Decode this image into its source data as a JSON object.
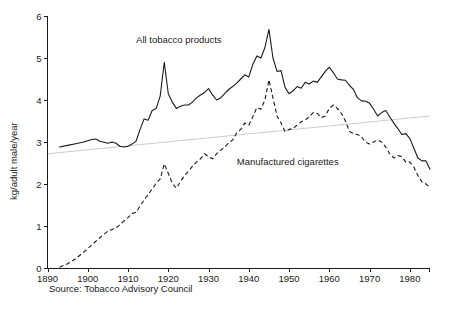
{
  "chart_data": {
    "type": "line",
    "title": "",
    "xlabel": "",
    "ylabel": "kg/adult male/year",
    "xlim": [
      1890,
      1985
    ],
    "ylim": [
      0,
      6
    ],
    "grid": false,
    "legend_position": "inline-annotation",
    "xticks": [
      1890,
      1900,
      1910,
      1920,
      1930,
      1940,
      1950,
      1960,
      1970,
      1980
    ],
    "yticks": [
      0,
      1,
      2,
      3,
      4,
      5,
      6
    ],
    "source": "Source: Tobacco Advisory Council",
    "annotations": [
      {
        "text": "All tobacco products",
        "x": 1912,
        "y": 5.35
      },
      {
        "text": "Manufactured cigarettes",
        "x": 1937,
        "y": 2.45
      }
    ],
    "series": [
      {
        "name": "All tobacco products",
        "style": "solid",
        "color": "#1a1a1a",
        "x": [
          1893,
          1895,
          1897,
          1899,
          1901,
          1902,
          1903,
          1905,
          1906,
          1907,
          1908,
          1909,
          1910,
          1911,
          1912,
          1913,
          1914,
          1915,
          1916,
          1917,
          1918,
          1919,
          1920,
          1921,
          1922,
          1923,
          1924,
          1925,
          1926,
          1927,
          1928,
          1929,
          1930,
          1931,
          1932,
          1933,
          1934,
          1935,
          1936,
          1937,
          1938,
          1939,
          1940,
          1941,
          1942,
          1943,
          1944,
          1945,
          1946,
          1947,
          1948,
          1949,
          1950,
          1951,
          1952,
          1953,
          1954,
          1955,
          1956,
          1957,
          1958,
          1959,
          1960,
          1961,
          1962,
          1963,
          1964,
          1965,
          1966,
          1967,
          1968,
          1969,
          1970,
          1971,
          1972,
          1973,
          1974,
          1975,
          1976,
          1977,
          1978,
          1979,
          1980,
          1981,
          1982,
          1983,
          1984,
          1985
        ],
        "y": [
          2.88,
          2.92,
          2.96,
          3.0,
          3.06,
          3.07,
          3.02,
          2.97,
          3.0,
          2.97,
          2.9,
          2.88,
          2.9,
          2.95,
          3.02,
          3.3,
          3.55,
          3.52,
          3.75,
          3.8,
          4.1,
          4.9,
          4.15,
          3.95,
          3.8,
          3.85,
          3.88,
          3.88,
          3.95,
          4.05,
          4.12,
          4.18,
          4.27,
          4.12,
          4.0,
          4.05,
          4.15,
          4.25,
          4.32,
          4.4,
          4.5,
          4.6,
          4.55,
          4.85,
          5.05,
          5.0,
          5.25,
          5.68,
          5.0,
          4.68,
          4.7,
          4.3,
          4.15,
          4.22,
          4.32,
          4.28,
          4.42,
          4.38,
          4.45,
          4.42,
          4.55,
          4.68,
          4.78,
          4.65,
          4.5,
          4.48,
          4.47,
          4.35,
          4.25,
          4.05,
          3.98,
          3.97,
          3.92,
          3.78,
          3.62,
          3.7,
          3.75,
          3.6,
          3.45,
          3.32,
          3.18,
          3.2,
          3.08,
          2.85,
          2.62,
          2.55,
          2.55,
          2.35
        ]
      },
      {
        "name": "Manufactured cigarettes",
        "style": "dashed",
        "color": "#1a1a1a",
        "x": [
          1893,
          1895,
          1897,
          1899,
          1901,
          1903,
          1905,
          1907,
          1909,
          1910,
          1911,
          1912,
          1913,
          1914,
          1915,
          1916,
          1917,
          1918,
          1919,
          1920,
          1921,
          1922,
          1923,
          1924,
          1925,
          1926,
          1927,
          1928,
          1929,
          1930,
          1931,
          1932,
          1933,
          1934,
          1935,
          1936,
          1937,
          1938,
          1939,
          1940,
          1941,
          1942,
          1943,
          1944,
          1945,
          1946,
          1947,
          1948,
          1949,
          1950,
          1951,
          1952,
          1953,
          1954,
          1955,
          1956,
          1957,
          1958,
          1959,
          1960,
          1961,
          1962,
          1963,
          1964,
          1965,
          1966,
          1967,
          1968,
          1969,
          1970,
          1971,
          1972,
          1973,
          1974,
          1975,
          1976,
          1977,
          1978,
          1979,
          1980,
          1981,
          1982,
          1983,
          1984,
          1985
        ],
        "y": [
          0.02,
          0.1,
          0.22,
          0.38,
          0.55,
          0.72,
          0.88,
          0.95,
          1.12,
          1.2,
          1.3,
          1.32,
          1.48,
          1.62,
          1.75,
          1.88,
          2.02,
          2.12,
          2.48,
          2.25,
          2.02,
          1.9,
          2.05,
          2.2,
          2.3,
          2.42,
          2.52,
          2.6,
          2.72,
          2.65,
          2.6,
          2.72,
          2.8,
          2.88,
          2.98,
          3.05,
          3.22,
          3.3,
          3.45,
          3.4,
          3.6,
          3.82,
          3.78,
          4.0,
          4.48,
          4.05,
          3.62,
          3.45,
          3.25,
          3.3,
          3.32,
          3.4,
          3.48,
          3.52,
          3.6,
          3.7,
          3.68,
          3.58,
          3.62,
          3.8,
          3.88,
          3.8,
          3.68,
          3.5,
          3.25,
          3.2,
          3.18,
          3.12,
          3.0,
          2.95,
          3.0,
          3.05,
          3.0,
          2.88,
          2.72,
          2.62,
          2.68,
          2.65,
          2.52,
          2.52,
          2.4,
          2.2,
          2.05,
          2.0,
          1.92
        ]
      }
    ],
    "reference_line": {
      "name": "trend-line",
      "color": "#cccccc",
      "x_start": 1890,
      "y_start": 2.72,
      "x_end": 1985,
      "y_end": 3.62
    }
  }
}
